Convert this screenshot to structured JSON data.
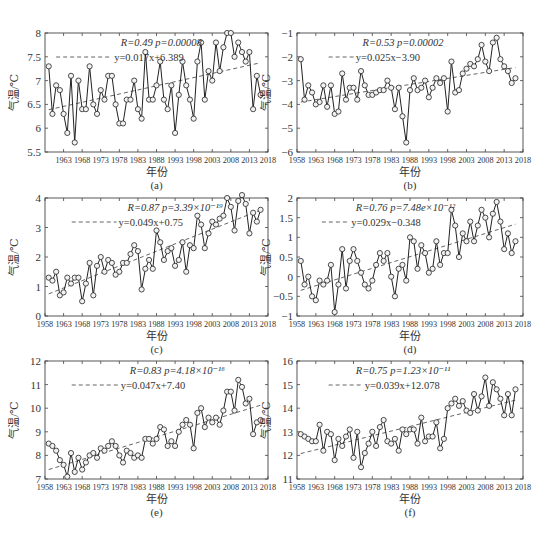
{
  "figure": {
    "x_axis_label": "年份",
    "y_axis_label": "气温/℃"
  },
  "chart_data": [
    {
      "type": "line",
      "panel_label": "(a)",
      "xlabel": "年份",
      "ylabel": "气温/℃",
      "xlim": [
        1958,
        2018
      ],
      "ylim": [
        5.5,
        8
      ],
      "xticks": [
        1963,
        1968,
        1973,
        1978,
        1983,
        1988,
        1993,
        1998,
        2003,
        2008,
        2013,
        2018
      ],
      "yticks": [
        5.5,
        6,
        6.5,
        7,
        7.5,
        8
      ],
      "annotation_stats": "R=0.49 p=0.00008",
      "annotation_fit": "y=0.017x+6.389",
      "fit": {
        "slope": 0.017,
        "intercept": 6.389
      },
      "x": [
        1959,
        1960,
        1961,
        1962,
        1963,
        1964,
        1965,
        1966,
        1967,
        1968,
        1969,
        1970,
        1971,
        1972,
        1973,
        1974,
        1975,
        1976,
        1977,
        1978,
        1979,
        1980,
        1981,
        1982,
        1983,
        1984,
        1985,
        1986,
        1987,
        1988,
        1989,
        1990,
        1991,
        1992,
        1993,
        1994,
        1995,
        1996,
        1997,
        1998,
        1999,
        2000,
        2001,
        2002,
        2003,
        2004,
        2005,
        2006,
        2007,
        2008,
        2009,
        2010,
        2011,
        2012,
        2013,
        2014,
        2015,
        2016
      ],
      "series": [
        {
          "name": "气温",
          "values": [
            7.3,
            6.3,
            6.9,
            6.8,
            6.3,
            5.9,
            7.1,
            5.7,
            7.0,
            6.4,
            6.4,
            7.3,
            6.5,
            6.3,
            6.8,
            6.6,
            7.1,
            7.1,
            6.5,
            6.1,
            6.1,
            6.6,
            6.6,
            7.0,
            6.4,
            6.2,
            7.6,
            6.6,
            6.6,
            6.9,
            7.4,
            6.6,
            6.4,
            6.9,
            5.9,
            6.7,
            7.4,
            6.9,
            6.6,
            6.2,
            7.4,
            7.8,
            6.6,
            7.2,
            7.0,
            7.8,
            7.2,
            7.7,
            8.0,
            8.0,
            7.5,
            7.8,
            7.6,
            7.4,
            7.6,
            6.4,
            7.1,
            6.7
          ]
        }
      ],
      "legend": [
        "R=0.49 p=0.00008",
        "y=0.017x+6.389"
      ],
      "grid": false
    },
    {
      "type": "line",
      "panel_label": "(b)",
      "xlabel": "年份",
      "ylabel": "气温/℃",
      "xlim": [
        1958,
        2018
      ],
      "ylim": [
        -6,
        -1
      ],
      "xticks": [
        1958,
        1963,
        1968,
        1973,
        1978,
        1983,
        1988,
        1993,
        1998,
        2003,
        2008,
        2013,
        2018
      ],
      "yticks": [
        -6,
        -5,
        -4,
        -3,
        -2,
        -1
      ],
      "annotation_stats": "R=0.53 p=0.00002",
      "annotation_fit": "y=0.025x−3.90",
      "fit": {
        "slope": 0.025,
        "intercept": -3.9
      },
      "x": [
        1959,
        1960,
        1961,
        1962,
        1963,
        1964,
        1965,
        1966,
        1967,
        1968,
        1969,
        1970,
        1971,
        1972,
        1973,
        1974,
        1975,
        1976,
        1977,
        1978,
        1979,
        1980,
        1981,
        1982,
        1983,
        1984,
        1985,
        1986,
        1987,
        1988,
        1989,
        1990,
        1991,
        1992,
        1993,
        1994,
        1995,
        1996,
        1997,
        1998,
        1999,
        2000,
        2001,
        2002,
        2003,
        2004,
        2005,
        2006,
        2007,
        2008,
        2009,
        2010,
        2011,
        2012,
        2013,
        2014,
        2015,
        2016
      ],
      "series": [
        {
          "name": "气温",
          "values": [
            -2.1,
            -3.8,
            -3.2,
            -3.5,
            -4.0,
            -3.9,
            -3.2,
            -4.1,
            -3.2,
            -4.4,
            -4.3,
            -2.7,
            -3.8,
            -3.3,
            -3.3,
            -3.8,
            -2.6,
            -3.2,
            -3.6,
            -3.6,
            -3.5,
            -3.4,
            -3.4,
            -3.0,
            -3.3,
            -4.2,
            -3.3,
            -4.5,
            -5.6,
            -3.4,
            -2.9,
            -3.4,
            -3.3,
            -3.0,
            -3.7,
            -3.3,
            -2.9,
            -3.1,
            -2.9,
            -4.3,
            -2.2,
            -3.5,
            -3.4,
            -2.7,
            -2.5,
            -2.3,
            -2.4,
            -2.1,
            -1.5,
            -2.2,
            -2.6,
            -1.4,
            -1.2,
            -2.1,
            -2.4,
            -2.6,
            -3.1,
            -2.9
          ]
        }
      ],
      "legend": [
        "R=0.53 p=0.00002",
        "y=0.025x−3.90"
      ],
      "grid": false
    },
    {
      "type": "line",
      "panel_label": "(c)",
      "xlabel": "年份",
      "ylabel": "气温/℃",
      "xlim": [
        1958,
        2018
      ],
      "ylim": [
        0,
        4
      ],
      "xticks": [
        1958,
        1963,
        1968,
        1973,
        1978,
        1983,
        1988,
        1993,
        1998,
        2003,
        2008,
        2013,
        2018
      ],
      "yticks": [
        0,
        1,
        2,
        3,
        4
      ],
      "annotation_stats": "R=0.87 p=3.39×10⁻¹⁹",
      "annotation_fit": "y=0.049x+0.75",
      "fit": {
        "slope": 0.049,
        "intercept": 0.75
      },
      "x": [
        1959,
        1960,
        1961,
        1962,
        1963,
        1964,
        1965,
        1966,
        1967,
        1968,
        1969,
        1970,
        1971,
        1972,
        1973,
        1974,
        1975,
        1976,
        1977,
        1978,
        1979,
        1980,
        1981,
        1982,
        1983,
        1984,
        1985,
        1986,
        1987,
        1988,
        1989,
        1990,
        1991,
        1992,
        1993,
        1994,
        1995,
        1996,
        1997,
        1998,
        1999,
        2000,
        2001,
        2002,
        2003,
        2004,
        2005,
        2006,
        2007,
        2008,
        2009,
        2010,
        2011,
        2012,
        2013,
        2014,
        2015,
        2016
      ],
      "series": [
        {
          "name": "气温",
          "values": [
            1.3,
            1.2,
            1.5,
            0.7,
            0.8,
            1.3,
            1.1,
            1.3,
            1.3,
            0.5,
            1.1,
            1.8,
            0.7,
            1.7,
            2.0,
            1.5,
            1.9,
            1.8,
            1.4,
            1.5,
            1.8,
            1.8,
            2.1,
            2.4,
            2.2,
            0.9,
            1.6,
            1.9,
            1.6,
            2.9,
            2.5,
            1.9,
            2.2,
            2.3,
            1.7,
            1.9,
            2.5,
            1.5,
            2.4,
            2.3,
            3.4,
            3.1,
            2.3,
            2.8,
            3.2,
            3.1,
            3.3,
            3.4,
            4.0,
            3.7,
            2.9,
            3.9,
            4.1,
            3.8,
            2.8,
            3.5,
            3.2,
            3.6
          ]
        }
      ],
      "legend": [
        "R=0.87 p=3.39×10⁻¹⁹",
        "y=0.049x+0.75"
      ],
      "grid": false
    },
    {
      "type": "line",
      "panel_label": "(d)",
      "xlabel": "年份",
      "ylabel": "气温/℃",
      "xlim": [
        1958,
        2018
      ],
      "ylim": [
        -1,
        2
      ],
      "xticks": [
        1958,
        1963,
        1968,
        1973,
        1978,
        1983,
        1988,
        1993,
        1998,
        2003,
        2008,
        2013,
        2018
      ],
      "yticks": [
        -1,
        -0.5,
        0,
        0.5,
        1,
        1.5,
        2
      ],
      "annotation_stats": "R=0.76 p=7.48e×10⁻¹²",
      "annotation_fit": "y=0.029x−0.348",
      "fit": {
        "slope": 0.029,
        "intercept": -0.348
      },
      "x": [
        1959,
        1960,
        1961,
        1962,
        1963,
        1964,
        1965,
        1966,
        1967,
        1968,
        1969,
        1970,
        1971,
        1972,
        1973,
        1974,
        1975,
        1976,
        1977,
        1978,
        1979,
        1980,
        1981,
        1982,
        1983,
        1984,
        1985,
        1986,
        1987,
        1988,
        1989,
        1990,
        1991,
        1992,
        1993,
        1994,
        1995,
        1996,
        1997,
        1998,
        1999,
        2000,
        2001,
        2002,
        2003,
        2004,
        2005,
        2006,
        2007,
        2008,
        2009,
        2010,
        2011,
        2012,
        2013,
        2014,
        2015,
        2016
      ],
      "series": [
        {
          "name": "气温",
          "values": [
            0.4,
            -0.2,
            0.0,
            -0.5,
            -0.6,
            -0.1,
            -0.2,
            -0.1,
            0.3,
            -0.9,
            -0.2,
            0.7,
            -0.3,
            0.4,
            0.7,
            0.4,
            0.1,
            -0.2,
            -0.3,
            -0.1,
            0.3,
            0.6,
            0.4,
            0.6,
            0.0,
            -0.5,
            0.2,
            0.3,
            -0.1,
            1.0,
            0.9,
            0.2,
            0.8,
            0.6,
            0.1,
            0.2,
            0.9,
            0.3,
            0.6,
            0.6,
            1.7,
            1.3,
            0.5,
            1.1,
            0.9,
            1.4,
            0.9,
            1.3,
            1.7,
            1.5,
            1.0,
            1.6,
            1.9,
            1.4,
            0.7,
            1.1,
            0.6,
            0.9
          ]
        }
      ],
      "legend": [
        "R=0.76 p=7.48e×10⁻¹²",
        "y=0.029x−0.348"
      ],
      "grid": false
    },
    {
      "type": "line",
      "panel_label": "(e)",
      "xlabel": "年份",
      "ylabel": "气温/℃",
      "xlim": [
        1958,
        2018
      ],
      "ylim": [
        7,
        12
      ],
      "xticks": [
        1958,
        1963,
        1968,
        1973,
        1978,
        1983,
        1988,
        1993,
        1998,
        2003,
        2008,
        2013,
        2018
      ],
      "yticks": [
        7,
        8,
        9,
        10,
        11,
        12
      ],
      "annotation_stats": "R=0.83 p=4.18×10⁻¹⁶",
      "annotation_fit": "y=0.047x+7.40",
      "fit": {
        "slope": 0.047,
        "intercept": 7.4
      },
      "x": [
        1959,
        1960,
        1961,
        1962,
        1963,
        1964,
        1965,
        1966,
        1967,
        1968,
        1969,
        1970,
        1971,
        1972,
        1973,
        1974,
        1975,
        1976,
        1977,
        1978,
        1979,
        1980,
        1981,
        1982,
        1983,
        1984,
        1985,
        1986,
        1987,
        1988,
        1989,
        1990,
        1991,
        1992,
        1993,
        1994,
        1995,
        1996,
        1997,
        1998,
        1999,
        2000,
        2001,
        2002,
        2003,
        2004,
        2005,
        2006,
        2007,
        2008,
        2009,
        2010,
        2011,
        2012,
        2013,
        2014,
        2015,
        2016
      ],
      "series": [
        {
          "name": "气温",
          "values": [
            8.5,
            8.4,
            8.2,
            7.8,
            7.6,
            7.1,
            8.1,
            7.3,
            7.9,
            7.4,
            7.7,
            8.0,
            8.1,
            7.9,
            8.3,
            8.2,
            8.4,
            8.6,
            8.4,
            8.0,
            7.7,
            8.2,
            8.1,
            7.9,
            8.0,
            7.9,
            8.7,
            8.7,
            8.5,
            8.7,
            9.2,
            9.1,
            8.4,
            8.6,
            8.4,
            9.0,
            9.3,
            9.5,
            9.3,
            8.3,
            9.8,
            10.0,
            9.2,
            9.6,
            9.4,
            9.6,
            9.3,
            9.9,
            10.7,
            10.7,
            9.9,
            11.2,
            10.9,
            10.2,
            10.4,
            8.9,
            9.4,
            9.5
          ]
        }
      ],
      "legend": [
        "R=0.83 p=4.18×10⁻¹⁶",
        "y=0.047x+7.40"
      ],
      "grid": false
    },
    {
      "type": "line",
      "panel_label": "(f)",
      "xlabel": "年份",
      "ylabel": "气温/℃",
      "xlim": [
        1958,
        2018
      ],
      "ylim": [
        11,
        16
      ],
      "xticks": [
        1958,
        1963,
        1968,
        1973,
        1978,
        1983,
        1988,
        1993,
        1998,
        2003,
        2008,
        2013,
        2018
      ],
      "yticks": [
        11,
        12,
        13,
        14,
        15,
        16
      ],
      "annotation_stats": "R=0.75 p=1.23×10⁻¹¹",
      "annotation_fit": "y=0.039x+12.078",
      "fit": {
        "slope": 0.039,
        "intercept": 12.078
      },
      "x": [
        1959,
        1960,
        1961,
        1962,
        1963,
        1964,
        1965,
        1966,
        1967,
        1968,
        1969,
        1970,
        1971,
        1972,
        1973,
        1974,
        1975,
        1976,
        1977,
        1978,
        1979,
        1980,
        1981,
        1982,
        1983,
        1984,
        1985,
        1986,
        1987,
        1988,
        1989,
        1990,
        1991,
        1992,
        1993,
        1994,
        1995,
        1996,
        1997,
        1998,
        1999,
        2000,
        2001,
        2002,
        2003,
        2004,
        2005,
        2006,
        2007,
        2008,
        2009,
        2010,
        2011,
        2012,
        2013,
        2014,
        2015,
        2016
      ],
      "series": [
        {
          "name": "气温",
          "values": [
            12.9,
            12.8,
            12.7,
            12.6,
            12.6,
            13.3,
            12.2,
            13.0,
            12.9,
            11.8,
            12.7,
            12.4,
            12.8,
            13.1,
            11.9,
            13.0,
            11.5,
            12.1,
            12.5,
            13.0,
            12.4,
            13.2,
            13.5,
            12.6,
            12.5,
            12.7,
            12.2,
            13.1,
            12.9,
            13.1,
            13.1,
            12.5,
            13.6,
            12.6,
            12.8,
            12.8,
            13.4,
            12.3,
            12.7,
            14.0,
            14.2,
            14.4,
            14.1,
            14.3,
            13.9,
            13.8,
            14.6,
            13.9,
            14.5,
            15.3,
            14.1,
            15.1,
            14.8,
            14.4,
            13.7,
            14.6,
            13.7,
            14.8
          ]
        }
      ],
      "legend": [
        "R=0.75 p=1.23×10⁻¹¹",
        "y=0.039x+12.078"
      ],
      "grid": false
    }
  ]
}
